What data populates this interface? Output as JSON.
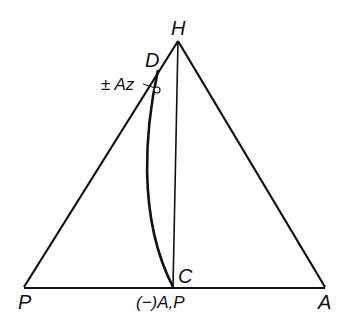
{
  "diagram": {
    "type": "triangle-vector-diagram",
    "colors": {
      "line": "#111111",
      "background": "#ffffff"
    },
    "labels": {
      "apex": "H",
      "left_vertex": "P",
      "right_vertex": "A",
      "curve_top": "D",
      "curve_bottom": "C",
      "azimuth": "± Az",
      "base_mid": "(−)A,P"
    },
    "points": {
      "H": [
        178,
        41
      ],
      "P": [
        24,
        287
      ],
      "A": [
        325,
        287
      ],
      "C": [
        173,
        287
      ],
      "D": [
        158,
        70
      ],
      "circle": [
        157,
        90
      ]
    },
    "elements": [
      "triangle PHA",
      "vertical line H–C",
      "curve D–C",
      "small circle marker near D"
    ]
  }
}
